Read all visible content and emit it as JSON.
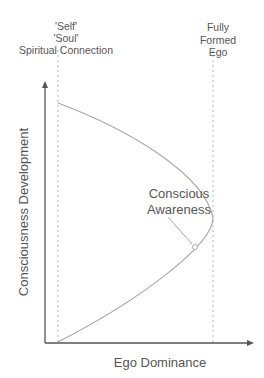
{
  "diagram": {
    "top_left_label": [
      "'Self'",
      "'Soul'",
      "Spiritual Connection"
    ],
    "top_right_label": [
      "Fully",
      "Formed",
      "Ego"
    ],
    "annotation": [
      "Conscious",
      "Awareness"
    ],
    "x_axis_label": "Ego Dominance",
    "y_axis_label": "Consciousness Development",
    "colors": {
      "axis": "#555555",
      "curve": "#a8a8a8",
      "dashed": "#b0b0b0",
      "text": "#555555"
    }
  }
}
